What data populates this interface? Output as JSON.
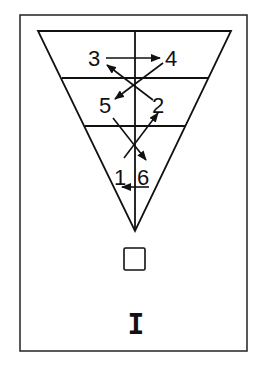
{
  "diagram": {
    "type": "inverted-triangle-sequence",
    "colors": {
      "line": "#111111",
      "background": "#ffffff"
    },
    "frame": {
      "x": 20,
      "y": 15,
      "w": 227,
      "h": 336
    },
    "triangle": {
      "top_left": [
        38,
        31
      ],
      "top_right": [
        231,
        31
      ],
      "apex": [
        135,
        231
      ]
    },
    "rows": 3,
    "labels": [
      {
        "id": "1",
        "text": "1",
        "x": 114,
        "y": 185
      },
      {
        "id": "2",
        "text": "2",
        "x": 152,
        "y": 113
      },
      {
        "id": "3",
        "text": "3",
        "x": 88,
        "y": 66
      },
      {
        "id": "4",
        "text": "4",
        "x": 165,
        "y": 66
      },
      {
        "id": "5",
        "text": "5",
        "x": 99,
        "y": 113
      },
      {
        "id": "6",
        "text": "6",
        "x": 137,
        "y": 185
      }
    ],
    "sequence": [
      "1",
      "2",
      "3",
      "4",
      "5",
      "6",
      "1"
    ],
    "square_symbol": "square",
    "bottom_symbol": "I"
  }
}
